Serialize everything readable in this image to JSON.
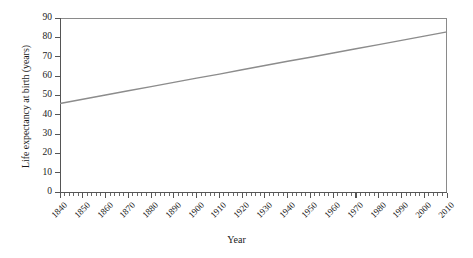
{
  "chart_data": {
    "type": "line",
    "title": "",
    "xlabel": "Year",
    "ylabel": "Life expectancy at birth (years)",
    "xlim": [
      1840,
      2010
    ],
    "ylim": [
      0,
      90
    ],
    "grid": false,
    "legend": "none",
    "line_color": "#8c8c8c",
    "axis_color": "#555555",
    "x_tick_labels": [
      "1840",
      "1850",
      "1860",
      "1870",
      "1880",
      "1890",
      "1900",
      "1910",
      "1920",
      "1930",
      "1940",
      "1950",
      "1960",
      "1970",
      "1980",
      "1990",
      "2000",
      "2010"
    ],
    "y_tick_labels": [
      "0",
      "10",
      "20",
      "30",
      "40",
      "50",
      "60",
      "70",
      "80",
      "90"
    ],
    "x": [
      1840,
      1850,
      1860,
      1870,
      1880,
      1890,
      1900,
      1910,
      1920,
      1930,
      1940,
      1950,
      1960,
      1970,
      1980,
      1990,
      2000,
      2010
    ],
    "series": [
      {
        "name": "Life expectancy at birth",
        "values": [
          45.8,
          48.0,
          50.2,
          52.4,
          54.5,
          56.7,
          58.9,
          61.0,
          63.2,
          65.4,
          67.6,
          69.7,
          71.9,
          74.1,
          76.2,
          78.4,
          80.6,
          82.8
        ]
      }
    ]
  }
}
